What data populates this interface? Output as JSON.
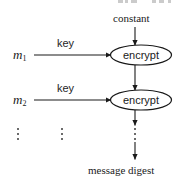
{
  "figure": {
    "kind": "block-diagram",
    "title_visible": false,
    "background_color": "#ffffff",
    "line_color": "#1a1a1a",
    "text_color": "#1a1a1a"
  },
  "labels": {
    "constant": "constant",
    "message_digest": "message digest",
    "key_1": "key",
    "key_2": "key",
    "message_1": "m",
    "message_1_sub": "1",
    "message_2": "m",
    "message_2_sub": "2"
  },
  "nodes": [
    {
      "id": "encrypt-1",
      "label": "encrypt",
      "shape": "ellipse"
    },
    {
      "id": "encrypt-2",
      "label": "encrypt",
      "shape": "ellipse"
    }
  ],
  "ellipsis": {
    "glyph": "vertical-ellipsis",
    "columns": [
      "messages",
      "keys",
      "chain"
    ]
  },
  "edges": [
    {
      "from": "constant",
      "to": "encrypt-1",
      "direction": "down",
      "label": ""
    },
    {
      "from": "message_1",
      "to": "encrypt-1",
      "direction": "right",
      "label": "key"
    },
    {
      "from": "encrypt-1",
      "to": "encrypt-2",
      "direction": "down",
      "label": ""
    },
    {
      "from": "message_2",
      "to": "encrypt-2",
      "direction": "right",
      "label": "key"
    },
    {
      "from": "encrypt-2",
      "to": "message_digest",
      "direction": "down",
      "label": ""
    }
  ]
}
